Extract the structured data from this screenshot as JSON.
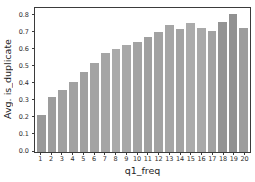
{
  "chart_data": {
    "type": "bar",
    "title": "",
    "xlabel": "q1_freq",
    "ylabel": "Avg. is_duplicate",
    "categories": [
      "1",
      "2",
      "3",
      "4",
      "5",
      "6",
      "7",
      "8",
      "9",
      "10",
      "11",
      "12",
      "13",
      "14",
      "15",
      "16",
      "17",
      "18",
      "19",
      "20"
    ],
    "values": [
      0.22,
      0.32,
      0.365,
      0.41,
      0.47,
      0.52,
      0.58,
      0.605,
      0.63,
      0.645,
      0.675,
      0.705,
      0.745,
      0.72,
      0.755,
      0.725,
      0.71,
      0.765,
      0.81,
      0.725
    ],
    "ylim": [
      0,
      0.845
    ],
    "yticks": [
      0.0,
      0.1,
      0.2,
      0.3,
      0.4,
      0.5,
      0.6,
      0.7,
      0.8
    ],
    "ytick_labels": [
      "0.0",
      "0.1",
      "0.2",
      "0.3",
      "0.4",
      "0.5",
      "0.6",
      "0.7",
      "0.8"
    ],
    "grid": false,
    "legend_position": "none",
    "bar_colors": [
      "#999999",
      "#9d9d9d",
      "#a0a0a0",
      "#a2a2a2",
      "#a0a0a0",
      "#a3a3a3",
      "#a5a5a5",
      "#aaaaaa",
      "#a8a8a8",
      "#a3a3a3",
      "#a0a0a0",
      "#a2a2a2",
      "#a6a6a6",
      "#a3a3a3",
      "#ababab",
      "#a9a9a9",
      "#a2a2a2",
      "#949494",
      "#919191",
      "#9d9d9d"
    ],
    "spine_color": "#3b3b3b",
    "text_color": "#2e2e2e",
    "background_color": "#ffffff"
  }
}
